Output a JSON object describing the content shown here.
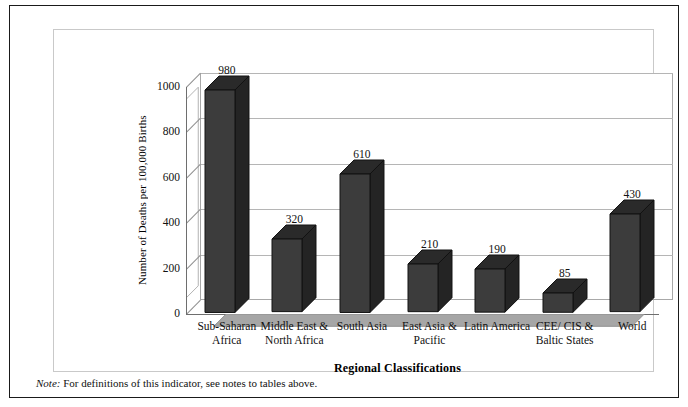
{
  "chart_data": {
    "type": "bar",
    "title": "",
    "subtitle": "",
    "xlabel": "Regional Classifications",
    "ylabel": "Number of Deaths per 100,000 Births",
    "categories": [
      "Sub-Saharan Africa",
      "Middle East & North Africa",
      "South Asia",
      "East Asia & Pacific",
      "Latin America",
      "CEE/ CIS & Baltic States",
      "World"
    ],
    "category_lines": [
      [
        "Sub-Saharan",
        "Africa"
      ],
      [
        "Middle East &",
        "North Africa"
      ],
      [
        "South Asia",
        ""
      ],
      [
        "East Asia &",
        "Pacific"
      ],
      [
        "Latin America",
        ""
      ],
      [
        "CEE/ CIS &",
        "Baltic States"
      ],
      [
        "World",
        ""
      ]
    ],
    "values": [
      980,
      320,
      610,
      210,
      190,
      85,
      430
    ],
    "data_labels": [
      "980",
      "320",
      "610",
      "210",
      "190",
      "85",
      "430"
    ],
    "ylim": [
      0,
      1000
    ],
    "yticks": [
      0,
      200,
      400,
      600,
      800,
      1000
    ],
    "ytick_labels": [
      "0",
      "200",
      "400",
      "600",
      "800",
      "1000"
    ],
    "grid": true,
    "legend": false,
    "legend_position": "none",
    "style": "3d-column",
    "bar_color": "#3c3c3c",
    "bar_top_color": "#2a2a2a",
    "bar_side_color": "#242424",
    "gridline_color": "#b5b5b5",
    "floor_color": "#a6a6a6",
    "plot_background": "#ffffff"
  },
  "footnote": {
    "prefix": "Note:",
    "text": " For definitions of this indicator, see notes to tables above."
  }
}
